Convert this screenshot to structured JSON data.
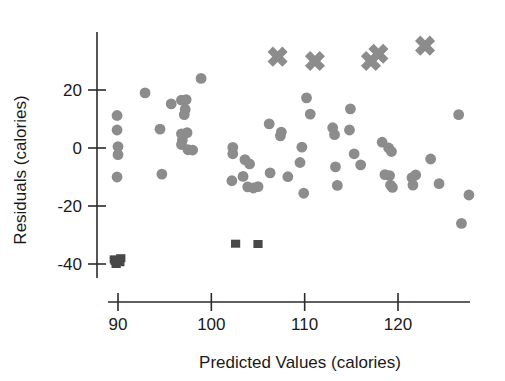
{
  "chart_data": {
    "type": "scatter",
    "title": "",
    "xlabel": "Predicted Values (calories)",
    "ylabel": "Residuals (calories)",
    "xlim": [
      86,
      130
    ],
    "ylim": [
      -43,
      36
    ],
    "xticks": [
      90,
      100,
      110,
      120
    ],
    "xtick_labels": [
      "90",
      "100",
      "110",
      "120"
    ],
    "yticks": [
      20,
      0,
      -20,
      -40
    ],
    "ytick_labels": [
      "20",
      "0",
      "-20",
      "-40"
    ],
    "grid": false,
    "legend": "none",
    "colors": {
      "circle_marker": "#8c8c8c",
      "square_marker": "#484848",
      "cross_marker": "#8c8c8c",
      "axis": "#2b2b2b",
      "background": "#ffffff"
    },
    "series": [
      {
        "name": "residuals-circles",
        "marker": "circle",
        "color": "#8c8c8c",
        "points": [
          [
            89.9,
            11.2
          ],
          [
            89.9,
            6.2
          ],
          [
            90.0,
            0.5
          ],
          [
            90.0,
            -2.3
          ],
          [
            89.9,
            -10.0
          ],
          [
            92.9,
            19.0
          ],
          [
            94.5,
            6.5
          ],
          [
            94.7,
            -9.0
          ],
          [
            95.7,
            15.2
          ],
          [
            96.8,
            16.5
          ],
          [
            97.3,
            16.7
          ],
          [
            97.2,
            13.3
          ],
          [
            97.1,
            11.5
          ],
          [
            96.8,
            4.9
          ],
          [
            97.4,
            5.3
          ],
          [
            96.9,
            2.8
          ],
          [
            96.8,
            1.2
          ],
          [
            97.5,
            -0.6
          ],
          [
            98.0,
            -0.7
          ],
          [
            98.9,
            24.0
          ],
          [
            102.3,
            0.2
          ],
          [
            102.3,
            -2.0
          ],
          [
            102.2,
            -11.3
          ],
          [
            103.4,
            -9.8
          ],
          [
            103.6,
            -4.0
          ],
          [
            104.1,
            -5.5
          ],
          [
            103.9,
            -13.4
          ],
          [
            104.5,
            -13.8
          ],
          [
            105.0,
            -13.3
          ],
          [
            106.2,
            8.3
          ],
          [
            106.3,
            -8.6
          ],
          [
            107.5,
            5.5
          ],
          [
            107.4,
            4.2
          ],
          [
            108.2,
            -9.9
          ],
          [
            109.7,
            0.3
          ],
          [
            109.5,
            -5.0
          ],
          [
            109.9,
            -15.6
          ],
          [
            110.2,
            17.3
          ],
          [
            110.6,
            11.7
          ],
          [
            113.0,
            7.0
          ],
          [
            113.2,
            4.6
          ],
          [
            113.3,
            -6.5
          ],
          [
            113.5,
            -12.9
          ],
          [
            114.9,
            13.5
          ],
          [
            114.8,
            6.2
          ],
          [
            115.3,
            -2.0
          ],
          [
            116.0,
            -5.8
          ],
          [
            118.3,
            2.0
          ],
          [
            119.0,
            0.0
          ],
          [
            119.3,
            -1.2
          ],
          [
            119.1,
            -9.5
          ],
          [
            118.6,
            -9.2
          ],
          [
            119.2,
            -12.8
          ],
          [
            119.4,
            -13.6
          ],
          [
            121.5,
            -10.2
          ],
          [
            121.9,
            -9.3
          ],
          [
            121.6,
            -12.8
          ],
          [
            123.5,
            -3.8
          ],
          [
            124.4,
            -12.3
          ],
          [
            126.5,
            11.5
          ],
          [
            126.8,
            -26.0
          ],
          [
            127.6,
            -16.2
          ]
        ]
      },
      {
        "name": "residuals-dark-squares",
        "marker": "square",
        "color": "#484848",
        "points": [
          [
            89.6,
            -38.4
          ],
          [
            90.0,
            -38.6
          ],
          [
            90.2,
            -39.4
          ],
          [
            89.8,
            -40.0
          ],
          [
            90.3,
            -38.0
          ],
          [
            89.7,
            -39.0
          ],
          [
            102.6,
            -33.0
          ],
          [
            105.0,
            -33.1
          ]
        ]
      },
      {
        "name": "residuals-crosses",
        "marker": "cross",
        "color": "#8c8c8c",
        "points": [
          [
            107.1,
            31.5
          ],
          [
            111.1,
            30.0
          ],
          [
            117.1,
            30.0
          ],
          [
            117.9,
            32.5
          ],
          [
            122.9,
            35.3
          ]
        ]
      }
    ]
  },
  "axes": {
    "y_axis_label": "Residuals (calories)",
    "x_axis_label": "Predicted Values (calories)"
  }
}
